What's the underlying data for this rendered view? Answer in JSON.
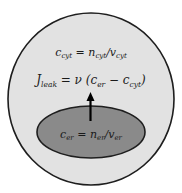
{
  "diagram": {
    "outer_region": {
      "label_base": "c",
      "label_sub": "cyt",
      "equation_rest": " = n",
      "n_sub": "cyt",
      "slash_v": "/v",
      "v_sub": "cyt",
      "fill": "#e2e2e2",
      "stroke": "#1e1e1e"
    },
    "flux": {
      "J": "J",
      "J_sub": "leak",
      "eq": " = ν (c",
      "c1_sub": "er",
      "minus": " − c",
      "c2_sub": "cyt",
      "close": ")"
    },
    "inner_region": {
      "label_base": "c",
      "label_sub": "er",
      "equation_rest": " = n",
      "n_sub": "er",
      "slash_v": "/v",
      "v_sub": "er",
      "fill": "#8a8a8a",
      "stroke": "#1e1e1e"
    },
    "arrow": {
      "direction": "up",
      "color": "#000000"
    }
  }
}
